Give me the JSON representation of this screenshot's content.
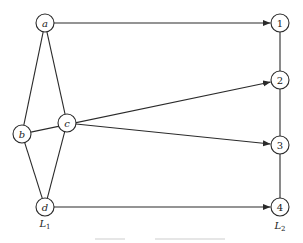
{
  "diagram": {
    "layers": {
      "left": {
        "label": "L",
        "subscript": "1",
        "x": 45,
        "y": 227
      },
      "right": {
        "label": "L",
        "subscript": "2",
        "x": 280,
        "y": 229
      }
    },
    "nodes": [
      {
        "id": "a",
        "label": "a",
        "x": 45,
        "y": 23,
        "italic": true
      },
      {
        "id": "b",
        "label": "b",
        "x": 22,
        "y": 134,
        "italic": true
      },
      {
        "id": "c",
        "label": "c",
        "x": 67,
        "y": 123,
        "italic": true
      },
      {
        "id": "d",
        "label": "d",
        "x": 45,
        "y": 207,
        "italic": true
      },
      {
        "id": "1",
        "label": "1",
        "x": 280,
        "y": 23,
        "italic": false
      },
      {
        "id": "2",
        "label": "2",
        "x": 280,
        "y": 80,
        "italic": false
      },
      {
        "id": "3",
        "label": "3",
        "x": 280,
        "y": 145,
        "italic": false
      },
      {
        "id": "4",
        "label": "4",
        "x": 280,
        "y": 207,
        "italic": false
      }
    ],
    "undirected_edges": [
      [
        "a",
        "b"
      ],
      [
        "a",
        "c"
      ],
      [
        "b",
        "d"
      ],
      [
        "c",
        "d"
      ],
      [
        "1",
        "2"
      ],
      [
        "2",
        "3"
      ],
      [
        "3",
        "4"
      ]
    ],
    "directed_edges": [
      [
        "a",
        "1"
      ],
      [
        "b",
        "2"
      ],
      [
        "c",
        "3"
      ],
      [
        "d",
        "4"
      ]
    ],
    "node_radius": 9,
    "caption": "Figure — bipartite layer diagram"
  }
}
